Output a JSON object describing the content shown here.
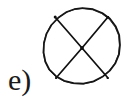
{
  "figure": {
    "label": "e)",
    "background_color": "#ffffff",
    "stroke_color": "#111111",
    "label_color": "#1a1a1a",
    "stroke_width": 1.7,
    "circle": {
      "center_x": 82,
      "center_y": 46,
      "radius": 38,
      "sides": 22,
      "style": "hand-drawn-polygonal"
    },
    "cross": {
      "line1": {
        "x1": 55,
        "y1": 17,
        "x2": 108,
        "y2": 78
      },
      "line2": {
        "x1": 108,
        "y1": 17,
        "x2": 56,
        "y2": 78
      },
      "intersection_x": 82,
      "intersection_y": 48
    }
  },
  "canvas": {
    "width": 131,
    "height": 112
  }
}
